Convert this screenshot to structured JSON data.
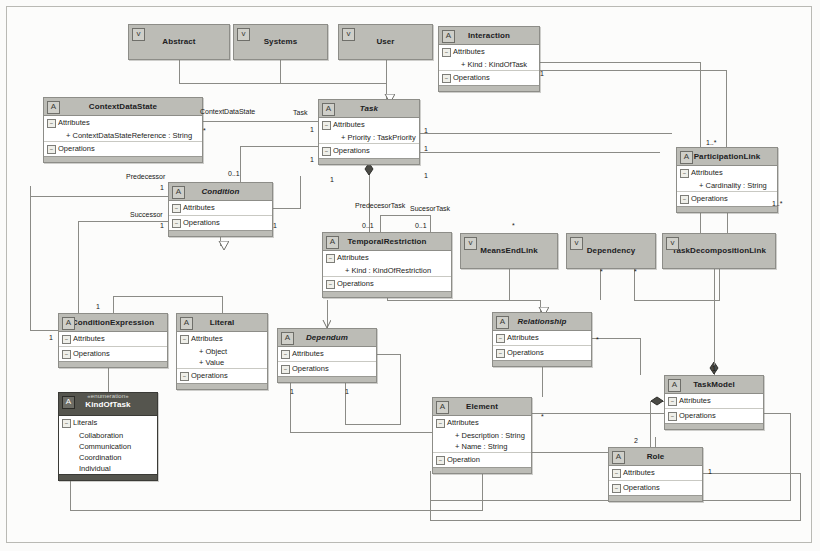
{
  "diagram": {
    "colors": {
      "header_fill": "#bcbcb6",
      "body_fill": "#ffffff",
      "line": "#6f6f6a",
      "enum_fill": "#55554e",
      "canvas": "#fcfcfb"
    },
    "labels": {
      "attributes": "Attributes",
      "operations": "Operations",
      "literals": "Literals",
      "expand_glyph": "−",
      "class_badge": "A",
      "simple_badge": "v",
      "enum_stereotype": "«enumeration»"
    },
    "classes": [
      {
        "id": "abstract",
        "name": "Abstract",
        "kind": "simple",
        "abstract": false,
        "x": 128,
        "y": 24,
        "w": 102,
        "h": 36,
        "attributes": [],
        "sections": []
      },
      {
        "id": "systems",
        "name": "Systems",
        "kind": "simple",
        "abstract": false,
        "x": 233,
        "y": 24,
        "w": 95,
        "h": 36,
        "attributes": [],
        "sections": []
      },
      {
        "id": "user",
        "name": "User",
        "kind": "simple",
        "abstract": false,
        "x": 338,
        "y": 24,
        "w": 95,
        "h": 36,
        "attributes": [],
        "sections": []
      },
      {
        "id": "interaction",
        "name": "Interaction",
        "kind": "class",
        "abstract": false,
        "x": 438,
        "y": 26,
        "w": 102,
        "h": 63,
        "attributes": [
          "+ Kind : KindOfTask"
        ],
        "sections": [
          "Attributes",
          "Operations"
        ]
      },
      {
        "id": "contextdatastate",
        "name": "ContextDataState",
        "kind": "class",
        "abstract": false,
        "x": 43,
        "y": 97,
        "w": 160,
        "h": 63,
        "attributes": [
          "+ ContextDataStateReference : String"
        ],
        "sections": [
          "Attributes",
          "Operations"
        ]
      },
      {
        "id": "task",
        "name": "Task",
        "kind": "class",
        "abstract": true,
        "x": 318,
        "y": 99,
        "w": 102,
        "h": 63,
        "attributes": [
          "+ Priority : TaskPriority"
        ],
        "sections": [
          "Attributes",
          "Operations"
        ]
      },
      {
        "id": "participationlink",
        "name": "ParticipationLink",
        "kind": "class",
        "abstract": false,
        "x": 676,
        "y": 147,
        "w": 102,
        "h": 63,
        "attributes": [
          "+ Cardinality : String"
        ],
        "sections": [
          "Attributes",
          "Operations"
        ]
      },
      {
        "id": "condition",
        "name": "Condition",
        "kind": "class",
        "abstract": true,
        "x": 168,
        "y": 182,
        "w": 105,
        "h": 52,
        "attributes": [],
        "sections": [
          "Attributes",
          "Operations"
        ]
      },
      {
        "id": "temporalrestriction",
        "name": "TemporalRestriction",
        "kind": "class",
        "abstract": false,
        "x": 322,
        "y": 232,
        "w": 130,
        "h": 63,
        "attributes": [
          "+ Kind : KindOfRestriction"
        ],
        "sections": [
          "Attributes",
          "Operations"
        ]
      },
      {
        "id": "meansendlink",
        "name": "MeansEndLink",
        "kind": "simple",
        "abstract": false,
        "x": 460,
        "y": 233,
        "w": 98,
        "h": 24,
        "attributes": [],
        "sections": []
      },
      {
        "id": "dependency",
        "name": "Dependency",
        "kind": "simple",
        "abstract": false,
        "x": 566,
        "y": 233,
        "w": 90,
        "h": 24,
        "attributes": [],
        "sections": []
      },
      {
        "id": "taskdecompositionlink",
        "name": "TaskDecompositionLink",
        "kind": "simple",
        "abstract": false,
        "x": 662,
        "y": 233,
        "w": 114,
        "h": 24,
        "attributes": [],
        "sections": []
      },
      {
        "id": "relationship",
        "name": "Relationship",
        "kind": "class",
        "abstract": true,
        "x": 492,
        "y": 312,
        "w": 100,
        "h": 52,
        "attributes": [],
        "sections": [
          "Attributes",
          "Operations"
        ]
      },
      {
        "id": "conditionexpression",
        "name": "ConditionExpression",
        "kind": "class",
        "abstract": false,
        "x": 58,
        "y": 313,
        "w": 110,
        "h": 52,
        "attributes": [],
        "sections": [
          "Attributes",
          "Operations"
        ]
      },
      {
        "id": "literal",
        "name": "Literal",
        "kind": "class",
        "abstract": false,
        "x": 176,
        "y": 313,
        "w": 92,
        "h": 65,
        "attributes": [
          "+ Object",
          "+ Value"
        ],
        "sections": [
          "Attributes",
          "Operations"
        ]
      },
      {
        "id": "dependum",
        "name": "Dependum",
        "kind": "class",
        "abstract": true,
        "x": 277,
        "y": 328,
        "w": 100,
        "h": 52,
        "attributes": [],
        "sections": [
          "Attributes",
          "Operations"
        ]
      },
      {
        "id": "taskmodel",
        "name": "TaskModel",
        "kind": "class",
        "abstract": false,
        "x": 664,
        "y": 375,
        "w": 100,
        "h": 52,
        "attributes": [],
        "sections": [
          "Attributes",
          "Operations"
        ]
      },
      {
        "id": "element",
        "name": "Element",
        "kind": "class",
        "abstract": false,
        "x": 432,
        "y": 397,
        "w": 100,
        "h": 74,
        "attributes": [
          "+ Description : String",
          "+ Name : String"
        ],
        "sections": [
          "Attributes",
          "Operation"
        ]
      },
      {
        "id": "role",
        "name": "Role",
        "kind": "class",
        "abstract": false,
        "x": 608,
        "y": 447,
        "w": 95,
        "h": 52,
        "attributes": [],
        "sections": [
          "Attributes",
          "Operations"
        ]
      },
      {
        "id": "kindoftask",
        "name": "KindOfTask",
        "kind": "enum",
        "abstract": false,
        "stereotype": "«enumeration»",
        "x": 58,
        "y": 392,
        "w": 100,
        "h": 88,
        "attributes": [],
        "sections": [
          "Literals"
        ],
        "literals": [
          "Collaboration",
          "Communication",
          "Coordination",
          "Individual"
        ]
      }
    ],
    "edge_labels": [
      {
        "text": "ContextDataState",
        "x": 200,
        "y": 108
      },
      {
        "text": "Task",
        "x": 293,
        "y": 109
      },
      {
        "text": "Predecessor",
        "x": 126,
        "y": 173
      },
      {
        "text": "Successor",
        "x": 130,
        "y": 211
      },
      {
        "text": "PredecesorTask",
        "x": 355,
        "y": 202
      },
      {
        "text": "SucesorTask",
        "x": 410,
        "y": 205
      }
    ],
    "multiplicities": [
      {
        "text": "1",
        "x": 540,
        "y": 70
      },
      {
        "text": "*",
        "x": 203,
        "y": 127
      },
      {
        "text": "1",
        "x": 310,
        "y": 126
      },
      {
        "text": "1",
        "x": 424,
        "y": 127
      },
      {
        "text": "1",
        "x": 424,
        "y": 145
      },
      {
        "text": "1",
        "x": 310,
        "y": 156
      },
      {
        "text": "1..*",
        "x": 706,
        "y": 139
      },
      {
        "text": "0..1",
        "x": 228,
        "y": 170
      },
      {
        "text": "1",
        "x": 160,
        "y": 184
      },
      {
        "text": "1",
        "x": 160,
        "y": 222
      },
      {
        "text": "1",
        "x": 330,
        "y": 176
      },
      {
        "text": "1",
        "x": 424,
        "y": 172
      },
      {
        "text": "0..1",
        "x": 362,
        "y": 222
      },
      {
        "text": "0..1",
        "x": 415,
        "y": 222
      },
      {
        "text": "1",
        "x": 273,
        "y": 222
      },
      {
        "text": "1..*",
        "x": 772,
        "y": 200
      },
      {
        "text": "*",
        "x": 512,
        "y": 222
      },
      {
        "text": "*",
        "x": 600,
        "y": 268
      },
      {
        "text": "*",
        "x": 634,
        "y": 268
      },
      {
        "text": "1",
        "x": 96,
        "y": 303
      },
      {
        "text": "1",
        "x": 49,
        "y": 334
      },
      {
        "text": "*",
        "x": 596,
        "y": 336
      },
      {
        "text": "1",
        "x": 712,
        "y": 365
      },
      {
        "text": "1",
        "x": 290,
        "y": 388
      },
      {
        "text": "1",
        "x": 345,
        "y": 388
      },
      {
        "text": "*",
        "x": 541,
        "y": 413
      },
      {
        "text": "2",
        "x": 634,
        "y": 437
      },
      {
        "text": "1",
        "x": 708,
        "y": 468
      }
    ]
  }
}
